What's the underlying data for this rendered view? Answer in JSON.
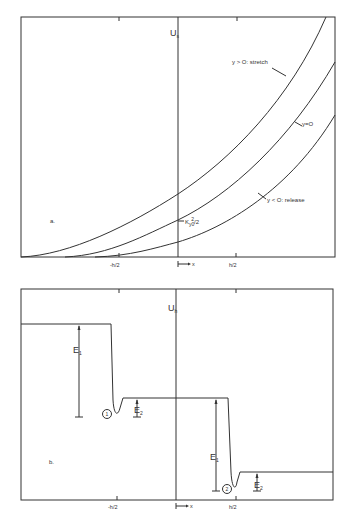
{
  "panel_a": {
    "tag": "a.",
    "axis_label": "U",
    "axis_sub": "s",
    "curves": [
      {
        "id": "stretch",
        "label": "y > O: stretch"
      },
      {
        "id": "zero",
        "label": "y=O"
      },
      {
        "id": "release",
        "label": "y < O: release"
      }
    ],
    "intercept_label": "K",
    "intercept_sub": "y0",
    "intercept_sup": "2",
    "intercept_tail": "/2",
    "ticks": {
      "left": "-h/2",
      "right": "h/2",
      "origin": "x"
    }
  },
  "panel_b": {
    "tag": "b.",
    "axis_label": "U",
    "axis_sub": "h",
    "wells": [
      {
        "id": "1",
        "label": "1",
        "E1": "E",
        "E1_sub": "1",
        "E2": "E",
        "E2_sub": "2"
      },
      {
        "id": "2",
        "label": "2",
        "E1": "E",
        "E1_sub": "1",
        "E2": "E",
        "E2_sub": "2"
      }
    ],
    "ticks": {
      "left": "-h/2",
      "right": "h/2",
      "origin": "x"
    }
  }
}
